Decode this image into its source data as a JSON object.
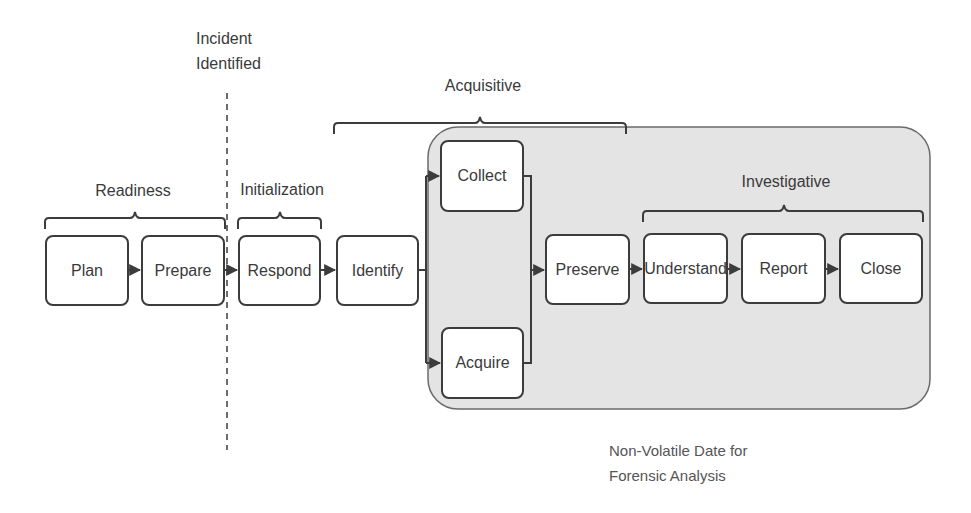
{
  "diagram": {
    "event_marker": {
      "line1": "Incident",
      "line2": "Identified"
    },
    "groups": {
      "readiness": "Readiness",
      "initialization": "Initialization",
      "acquisitive": "Acquisitive",
      "investigative": "Investigative"
    },
    "nodes": {
      "plan": "Plan",
      "prepare": "Prepare",
      "respond": "Respond",
      "identify": "Identify",
      "collect": "Collect",
      "acquire": "Acquire",
      "preserve": "Preserve",
      "understand": "Understand",
      "report": "Report",
      "close": "Close"
    },
    "container_caption": {
      "line1": "Non-Volatile Date for",
      "line2": "Forensic Analysis"
    },
    "colors": {
      "container_fill": "#e4e4e4",
      "stroke": "#3c3c3c",
      "node_fill": "#ffffff"
    }
  }
}
